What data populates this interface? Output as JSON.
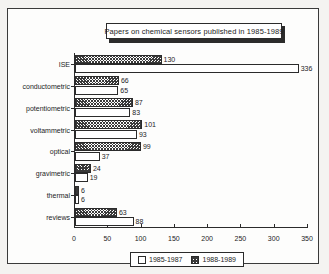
{
  "chart_data": {
    "type": "bar",
    "orientation": "horizontal",
    "title": "Papers on chemical sensors published in 1985-1989",
    "xlabel": "",
    "ylabel": "",
    "xlim": [
      0,
      350
    ],
    "xticks": [
      0,
      50,
      100,
      150,
      200,
      250,
      300,
      350
    ],
    "xtick_labels": [
      "0",
      "50",
      "100",
      "150",
      "200",
      "250",
      "300",
      "350"
    ],
    "grid": false,
    "legend_position": "bottom",
    "categories": [
      "ISE",
      "conductometric",
      "potentiometric",
      "voltammetric",
      "optical",
      "gravimetric",
      "thermal",
      "reviews"
    ],
    "series": [
      {
        "name": "1985-1987",
        "fill": "white",
        "values": [
          336,
          65,
          83,
          93,
          37,
          19,
          6,
          88
        ]
      },
      {
        "name": "1988-1989",
        "fill": "hatched",
        "values": [
          130,
          66,
          87,
          101,
          99,
          24,
          6,
          63
        ]
      }
    ]
  },
  "legend": {
    "entries": [
      {
        "label": "1985-1987",
        "swatch": "white-square-swatch"
      },
      {
        "label": "1988-1989",
        "swatch": "hatched-square-swatch"
      }
    ]
  },
  "colors": {
    "ink": "#2b2b2b",
    "paper": "#fdfdfc",
    "page_background": "#f4f3f1",
    "title_shadow": "#2b2b2b"
  }
}
